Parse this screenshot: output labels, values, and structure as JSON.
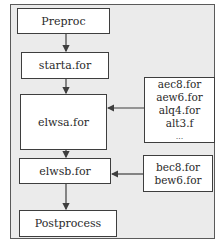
{
  "diagram": {
    "type": "flowchart",
    "colors": {
      "frame_bg": "#ebebeb",
      "box_bg": "#ffffff",
      "line": "#3e3e3e"
    },
    "nodes": {
      "preproc": {
        "label": "Preproc"
      },
      "starta": {
        "label": "starta.for"
      },
      "elwsa": {
        "label": "elwsa.for"
      },
      "elwsa_deps": {
        "items": [
          "aec8.for",
          "aew6.for",
          "alq4.for",
          "alt3.f",
          "..."
        ]
      },
      "elwsb": {
        "label": "elwsb.for"
      },
      "elwsb_deps": {
        "items": [
          "bec8.for",
          "bew6.for"
        ]
      },
      "postprocess": {
        "label": "Postprocess"
      }
    },
    "edges": [
      {
        "from": "Preproc",
        "to": "starta.for"
      },
      {
        "from": "starta.for",
        "to": "elwsa.for"
      },
      {
        "from": "aec8.for / aew6.for / alq4.for / alt3.f / ...",
        "to": "elwsa.for"
      },
      {
        "from": "elwsa.for",
        "to": "elwsb.for"
      },
      {
        "from": "bec8.for / bew6.for",
        "to": "elwsb.for"
      },
      {
        "from": "elwsb.for",
        "to": "Postprocess"
      }
    ]
  }
}
